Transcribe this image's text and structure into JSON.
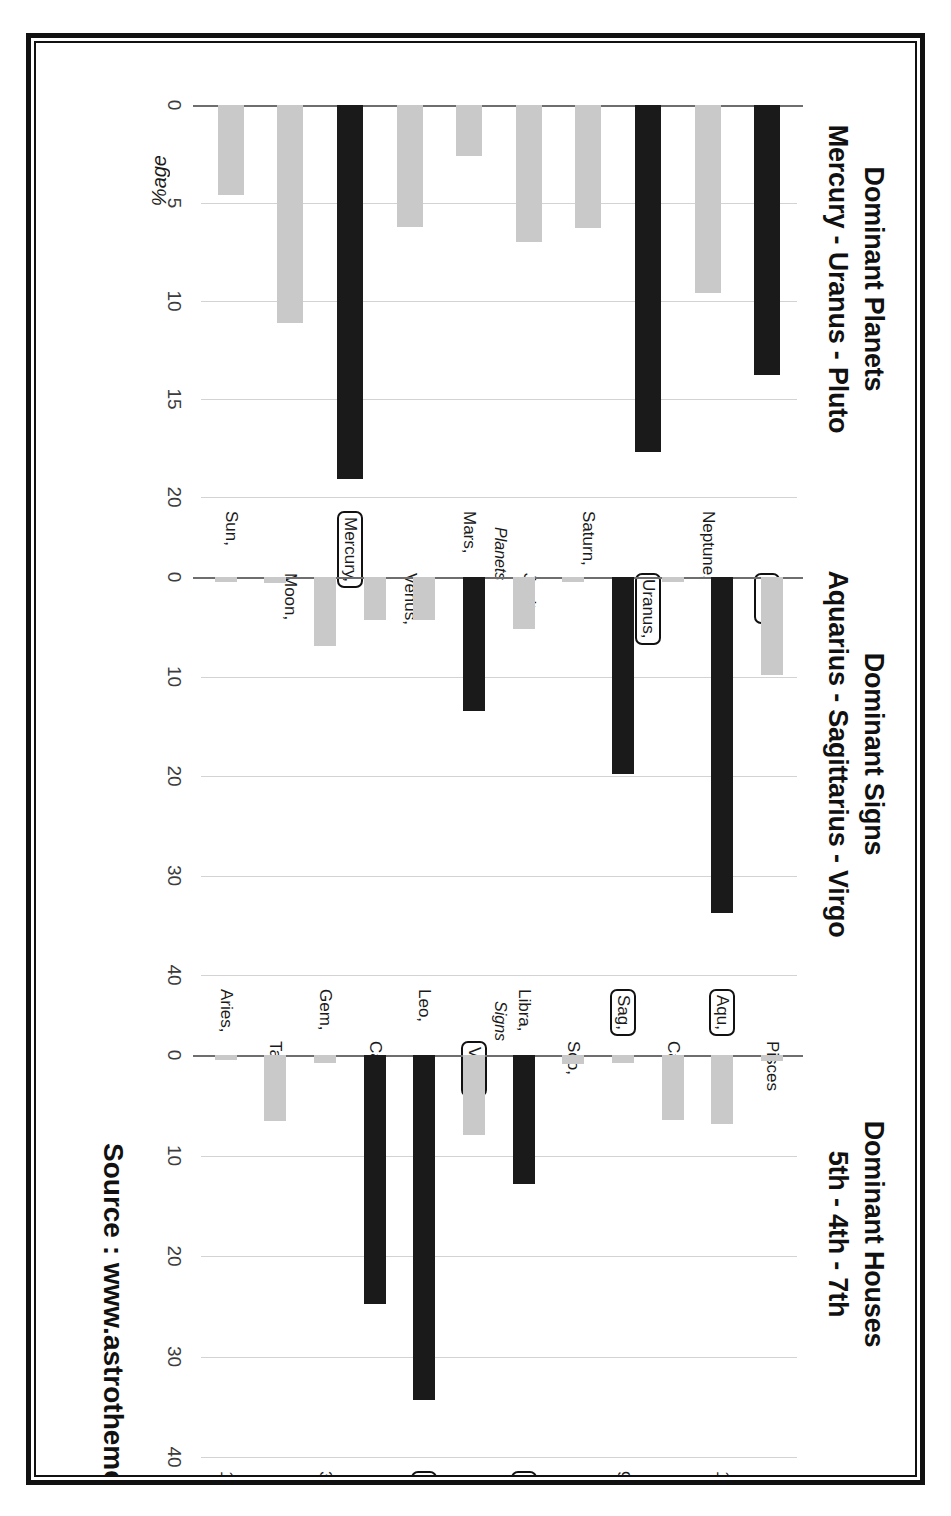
{
  "source_note": "Source : www.astrotheme.com",
  "y_axis_label": "%age",
  "colors": {
    "dominant": "#1a1a1a",
    "normal": "#c9c9c9",
    "grid": "#d3d3d3",
    "axis": "#6e6e6e"
  },
  "panels": {
    "planets": {
      "title_line1": "Dominant Planets",
      "title_line2": "Mercury - Uranus - Pluto",
      "axis_name": "Planets",
      "ticks": [
        "0",
        "5",
        "10",
        "15",
        "20"
      ]
    },
    "signs": {
      "title_line1": "Dominant Signs",
      "title_line2": "Aquarius - Sagittarius - Virgo",
      "axis_name": "Signs",
      "ticks": [
        "0",
        "10",
        "20",
        "30",
        "40"
      ]
    },
    "houses": {
      "title_line1": "Dominant Houses",
      "title_line2": "5th - 4th - 7th",
      "axis_name": "Houses",
      "ticks": [
        "0",
        "10",
        "20",
        "30",
        "40"
      ]
    }
  },
  "chart_data": [
    {
      "type": "bar",
      "orientation": "horizontal",
      "title": "Dominant Planets",
      "subtitle": "Mercury - Uranus - Pluto",
      "xlabel": "Planets",
      "ylabel": "%age",
      "ylim": [
        0,
        20
      ],
      "ticks": [
        0,
        5,
        10,
        15,
        20
      ],
      "grid": true,
      "categories": [
        "Sun,",
        "Moon,",
        "Mercury,",
        "Venus,",
        "Mars,",
        "Jupiter,",
        "Saturn,",
        "Uranus,",
        "Neptune,",
        "Pluto"
      ],
      "values": [
        4.6,
        11.1,
        19.1,
        6.2,
        2.6,
        7.0,
        6.3,
        17.7,
        9.6,
        13.8
      ],
      "highlighted": [
        "Mercury,",
        "Uranus,",
        "Pluto"
      ]
    },
    {
      "type": "bar",
      "orientation": "horizontal",
      "title": "Dominant Signs",
      "subtitle": "Aquarius - Sagittarius - Virgo",
      "xlabel": "Signs",
      "ylabel": "%age",
      "ylim": [
        0,
        40
      ],
      "ticks": [
        0,
        10,
        20,
        30,
        40
      ],
      "grid": true,
      "categories": [
        "Aries,",
        "Tau,",
        "Gem,",
        "Can,",
        "Leo,",
        "Virgo,",
        "Libra,",
        "Sco,",
        "Sag,",
        "Cap,",
        "Aqu,",
        "Pisces"
      ],
      "values": [
        0.5,
        0.6,
        6.9,
        4.3,
        4.3,
        13.5,
        5.2,
        0.5,
        19.8,
        0.5,
        33.8,
        9.8
      ],
      "highlighted": [
        "Virgo,",
        "Sag,",
        "Aqu,"
      ]
    },
    {
      "type": "bar",
      "orientation": "horizontal",
      "title": "Dominant Houses",
      "subtitle": "5th - 4th - 7th",
      "xlabel": "Houses",
      "ylabel": "%age",
      "ylim": [
        0,
        40
      ],
      "ticks": [
        0,
        10,
        20,
        30,
        40
      ],
      "grid": true,
      "categories": [
        "1,",
        "2,",
        "3,",
        "4,",
        "5,",
        "6,",
        "7,",
        "8,",
        "9,",
        "10,",
        "11,",
        "12"
      ],
      "values": [
        0.5,
        6.6,
        0.8,
        24.8,
        34.3,
        8.0,
        12.8,
        0.9,
        0.8,
        6.5,
        6.9,
        0.6
      ],
      "highlighted": [
        "4,",
        "5,",
        "7,"
      ]
    }
  ]
}
